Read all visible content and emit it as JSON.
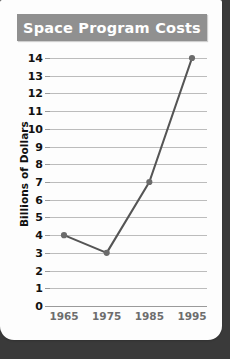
{
  "card": {
    "background_color": "#fdfdfd",
    "page_background_color": "#3a3a3a"
  },
  "title": {
    "text": "Space Program Costs",
    "banner_color": "#909090",
    "text_color": "#ffffff"
  },
  "chart_data": {
    "type": "line",
    "title": "Space Program Costs",
    "xlabel": "",
    "ylabel": "Billions of Dollars",
    "categories": [
      "1965",
      "1975",
      "1985",
      "1995"
    ],
    "x": [
      1965,
      1975,
      1985,
      1995
    ],
    "values": [
      4,
      3,
      7,
      14
    ],
    "series": [
      {
        "name": "Space Program Costs",
        "values": [
          4,
          3,
          7,
          14
        ]
      }
    ],
    "ylim": [
      0,
      14
    ],
    "ytick_labels": [
      "0",
      "1",
      "2",
      "3",
      "4",
      "5",
      "6",
      "7",
      "8",
      "9",
      "10",
      "11",
      "12",
      "13",
      "14"
    ],
    "ytick_values": [
      0,
      1,
      2,
      3,
      4,
      5,
      6,
      7,
      8,
      9,
      10,
      11,
      12,
      13,
      14
    ],
    "xtick_labels": [
      "1965",
      "1975",
      "1985",
      "1995"
    ],
    "grid": true,
    "legend": false,
    "legend_position": "none",
    "line_color": "#555555",
    "marker_color": "#6b6b6b",
    "gridline_color": "#bcbcbc",
    "axis_color": "#9a9a9a",
    "ytick_label_color": "#111111",
    "xtick_label_color": "#6d6d6d"
  }
}
